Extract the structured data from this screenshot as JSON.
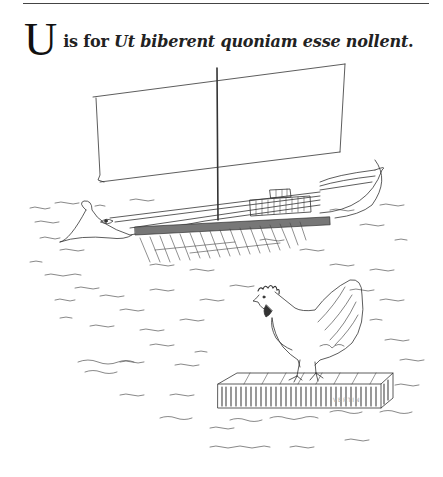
{
  "page": {
    "top_rule": true,
    "heading": {
      "drop_cap": "U",
      "lead_text": "is for ",
      "latin_phrase": "Ut biberent quoniam esse nollent",
      "terminal_punctuation": "."
    },
    "illustration": {
      "subjects": [
        "ancient-galley-warship",
        "hen",
        "wooden-raft",
        "sea-waves"
      ],
      "style": "pen-line-drawing",
      "line_color": "#333333",
      "background_color": "#ffffff"
    },
    "signature": "VERTIN"
  }
}
